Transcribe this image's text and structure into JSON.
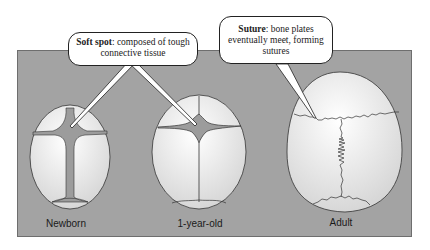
{
  "figure": {
    "panel_color": "#a3a3a3",
    "skull_fill": "#ebebeb",
    "fontanelle_fill": "#9c9c9c",
    "stages": [
      {
        "label": "Newborn"
      },
      {
        "label": "1-year-old"
      },
      {
        "label": "Adult"
      }
    ],
    "callouts": [
      {
        "term": "Soft spot",
        "text": ": composed of tough connective tissue",
        "points_to": [
          "Newborn",
          "1-year-old"
        ]
      },
      {
        "term": "Suture",
        "text": ": bone plates eventually meet, forming sutures",
        "points_to": [
          "Adult"
        ]
      }
    ]
  }
}
